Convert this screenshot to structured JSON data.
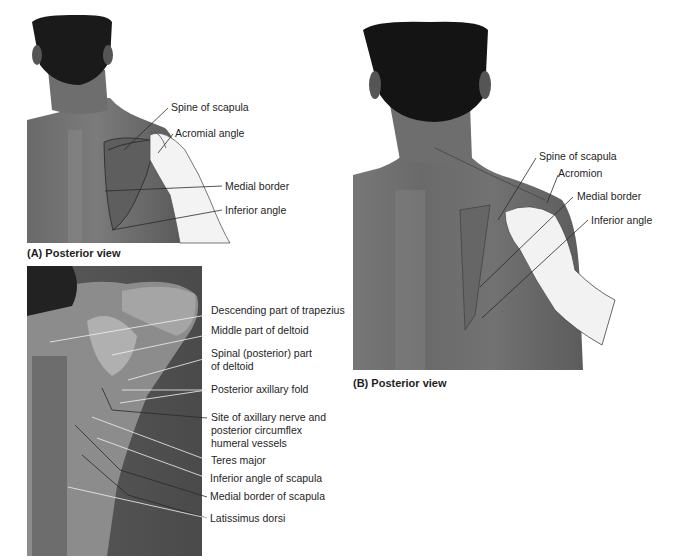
{
  "figure": {
    "panels": [
      {
        "id": "A",
        "caption": "(A) Posterior view",
        "labels": [
          "Spine of scapula",
          "Acromial angle",
          "Medial border",
          "Inferior angle"
        ]
      },
      {
        "id": "B",
        "caption": "(B) Posterior view",
        "labels": [
          "Spine of scapula",
          "Acromion",
          "Medial border",
          "Inferior angle"
        ]
      },
      {
        "id": "C",
        "caption": "",
        "labels": [
          "Descending part of trapezius",
          "Middle part of deltoid",
          "Spinal (posterior) part",
          "of deltoid",
          "Posterior axillary fold",
          "Site of axillary nerve and",
          "posterior circumflex",
          "humeral vessels",
          "Teres major",
          "Inferior angle of scapula",
          "Medial border of scapula",
          "Latissimus dorsi"
        ]
      }
    ]
  }
}
